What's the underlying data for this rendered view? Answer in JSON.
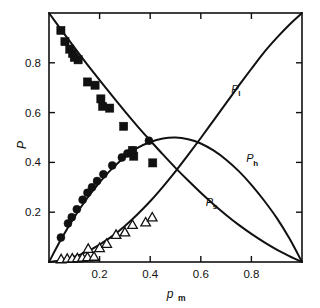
{
  "chart_data": {
    "type": "scatter",
    "title": "",
    "xlabel": "p_m",
    "xlabel_base": "p",
    "xlabel_sub": "m",
    "ylabel": "P",
    "xlim": [
      0,
      1
    ],
    "ylim": [
      0,
      1
    ],
    "grid": false,
    "legend_position": "inline-curve-labels",
    "xticks": [
      0.2,
      0.4,
      0.6,
      0.8
    ],
    "xticklabels": [
      "0.2",
      "0.4",
      "0.6",
      "0.8"
    ],
    "yticks": [
      0.2,
      0.4,
      0.6,
      0.8
    ],
    "yticklabels": [
      "0.2",
      "0.4",
      "0.6",
      "0.8"
    ],
    "annotations": [
      {
        "text": "P",
        "sub": "l",
        "x": 0.72,
        "y": 0.68
      },
      {
        "text": "P",
        "sub": "h",
        "x": 0.78,
        "y": 0.4
      },
      {
        "text": "P",
        "sub": "s",
        "x": 0.62,
        "y": 0.225
      }
    ],
    "series": [
      {
        "name": "P_s",
        "label": "P",
        "label_sub": "s",
        "marker": "filled-square",
        "curve_type": "line",
        "comment": "decreasing curve from (0,1) to (1,0)",
        "curve": [
          [
            0.0,
            1.0
          ],
          [
            0.05,
            0.93
          ],
          [
            0.1,
            0.862
          ],
          [
            0.15,
            0.795
          ],
          [
            0.2,
            0.73
          ],
          [
            0.25,
            0.667
          ],
          [
            0.3,
            0.605
          ],
          [
            0.35,
            0.545
          ],
          [
            0.4,
            0.488
          ],
          [
            0.45,
            0.432
          ],
          [
            0.5,
            0.378
          ],
          [
            0.55,
            0.327
          ],
          [
            0.6,
            0.278
          ],
          [
            0.65,
            0.232
          ],
          [
            0.7,
            0.189
          ],
          [
            0.75,
            0.149
          ],
          [
            0.8,
            0.113
          ],
          [
            0.85,
            0.08
          ],
          [
            0.9,
            0.05
          ],
          [
            0.95,
            0.024
          ],
          [
            1.0,
            0.0
          ]
        ],
        "points": [
          [
            0.047,
            0.93
          ],
          [
            0.063,
            0.885
          ],
          [
            0.082,
            0.855
          ],
          [
            0.093,
            0.838
          ],
          [
            0.1,
            0.822
          ],
          [
            0.115,
            0.812
          ],
          [
            0.152,
            0.723
          ],
          [
            0.182,
            0.71
          ],
          [
            0.205,
            0.655
          ],
          [
            0.212,
            0.625
          ],
          [
            0.24,
            0.618
          ],
          [
            0.295,
            0.545
          ],
          [
            0.33,
            0.448
          ],
          [
            0.335,
            0.425
          ],
          [
            0.41,
            0.398
          ]
        ]
      },
      {
        "name": "P_h",
        "label": "P",
        "label_sub": "h",
        "marker": "filled-circle",
        "curve_type": "line",
        "comment": "hump-shaped curve peaking near 0.50 at p_m = 0.50",
        "curve": [
          [
            0.0,
            0.0
          ],
          [
            0.05,
            0.095
          ],
          [
            0.1,
            0.18
          ],
          [
            0.15,
            0.255
          ],
          [
            0.2,
            0.32
          ],
          [
            0.25,
            0.376
          ],
          [
            0.3,
            0.422
          ],
          [
            0.35,
            0.458
          ],
          [
            0.4,
            0.482
          ],
          [
            0.45,
            0.496
          ],
          [
            0.5,
            0.5
          ],
          [
            0.55,
            0.493
          ],
          [
            0.6,
            0.476
          ],
          [
            0.65,
            0.448
          ],
          [
            0.7,
            0.411
          ],
          [
            0.75,
            0.365
          ],
          [
            0.8,
            0.31
          ],
          [
            0.85,
            0.247
          ],
          [
            0.9,
            0.177
          ],
          [
            0.95,
            0.095
          ],
          [
            1.0,
            0.0
          ]
        ],
        "points": [
          [
            0.047,
            0.098
          ],
          [
            0.075,
            0.155
          ],
          [
            0.09,
            0.18
          ],
          [
            0.11,
            0.212
          ],
          [
            0.133,
            0.25
          ],
          [
            0.152,
            0.278
          ],
          [
            0.17,
            0.3
          ],
          [
            0.19,
            0.325
          ],
          [
            0.215,
            0.352
          ],
          [
            0.25,
            0.388
          ],
          [
            0.288,
            0.42
          ],
          [
            0.31,
            0.436
          ],
          [
            0.33,
            0.448
          ],
          [
            0.395,
            0.487
          ]
        ]
      },
      {
        "name": "P_l",
        "label": "P",
        "label_sub": "l",
        "marker": "open-triangle",
        "curve_type": "line",
        "comment": "increasing convex curve from (0,0) to (1,1)",
        "curve": [
          [
            0.0,
            0.0
          ],
          [
            0.05,
            0.007
          ],
          [
            0.1,
            0.021
          ],
          [
            0.15,
            0.042
          ],
          [
            0.2,
            0.07
          ],
          [
            0.25,
            0.104
          ],
          [
            0.3,
            0.145
          ],
          [
            0.35,
            0.192
          ],
          [
            0.4,
            0.244
          ],
          [
            0.45,
            0.302
          ],
          [
            0.5,
            0.364
          ],
          [
            0.55,
            0.43
          ],
          [
            0.6,
            0.498
          ],
          [
            0.65,
            0.568
          ],
          [
            0.7,
            0.638
          ],
          [
            0.75,
            0.708
          ],
          [
            0.8,
            0.776
          ],
          [
            0.85,
            0.842
          ],
          [
            0.9,
            0.9
          ],
          [
            0.95,
            0.953
          ],
          [
            1.0,
            1.0
          ]
        ],
        "points": [
          [
            0.048,
            0.01
          ],
          [
            0.072,
            0.012
          ],
          [
            0.092,
            0.013
          ],
          [
            0.112,
            0.014
          ],
          [
            0.132,
            0.016
          ],
          [
            0.152,
            0.018
          ],
          [
            0.155,
            0.052
          ],
          [
            0.178,
            0.02
          ],
          [
            0.2,
            0.055
          ],
          [
            0.228,
            0.072
          ],
          [
            0.265,
            0.108
          ],
          [
            0.3,
            0.118
          ],
          [
            0.33,
            0.148
          ],
          [
            0.382,
            0.158
          ],
          [
            0.408,
            0.178
          ]
        ]
      }
    ]
  }
}
